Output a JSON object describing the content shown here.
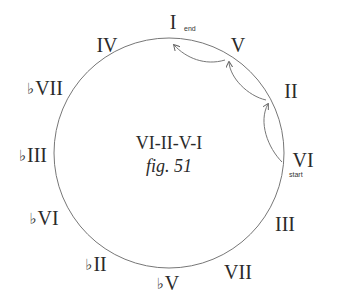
{
  "diagram": {
    "title": "VI-II-V-I",
    "figure_label": "fig. 51",
    "circle": {
      "cx": 169,
      "cy": 153,
      "r": 115,
      "stroke": "#777777"
    },
    "degrees": [
      {
        "id": "I",
        "flat": "",
        "numeral": "I",
        "x": 173,
        "y": 22
      },
      {
        "id": "V",
        "flat": "",
        "numeral": "V",
        "x": 238,
        "y": 45
      },
      {
        "id": "II",
        "flat": "",
        "numeral": "II",
        "x": 291,
        "y": 91
      },
      {
        "id": "VI",
        "flat": "",
        "numeral": "VI",
        "x": 303,
        "y": 160
      },
      {
        "id": "III",
        "flat": "",
        "numeral": "III",
        "x": 285,
        "y": 224
      },
      {
        "id": "VII",
        "flat": "",
        "numeral": "VII",
        "x": 238,
        "y": 272
      },
      {
        "id": "bV",
        "flat": "♭",
        "numeral": "V",
        "x": 168,
        "y": 283
      },
      {
        "id": "bII",
        "flat": "♭",
        "numeral": "II",
        "x": 96,
        "y": 264
      },
      {
        "id": "bVI",
        "flat": "♭",
        "numeral": "VI",
        "x": 44,
        "y": 218
      },
      {
        "id": "bIII",
        "flat": "♭",
        "numeral": "III",
        "x": 33,
        "y": 155
      },
      {
        "id": "bVII",
        "flat": "♭",
        "numeral": "VII",
        "x": 45,
        "y": 88
      },
      {
        "id": "IV",
        "flat": "",
        "numeral": "IV",
        "x": 107,
        "y": 45
      }
    ],
    "tags": {
      "end": {
        "text": "end",
        "x": 184,
        "y": 25
      },
      "start": {
        "text": "start",
        "x": 289,
        "y": 171
      }
    },
    "progression": [
      "VI",
      "II",
      "V",
      "I"
    ],
    "arrows": [
      {
        "from": "VI",
        "to": "II",
        "path": "M 282 162 C 268 148, 258 122, 268 104"
      },
      {
        "from": "II",
        "to": "V",
        "path": "M 266 100 C 248 96, 230 78, 229 62"
      },
      {
        "from": "V",
        "to": "I",
        "path": "M 225 60 C 205 66, 186 58, 174 45"
      }
    ]
  }
}
